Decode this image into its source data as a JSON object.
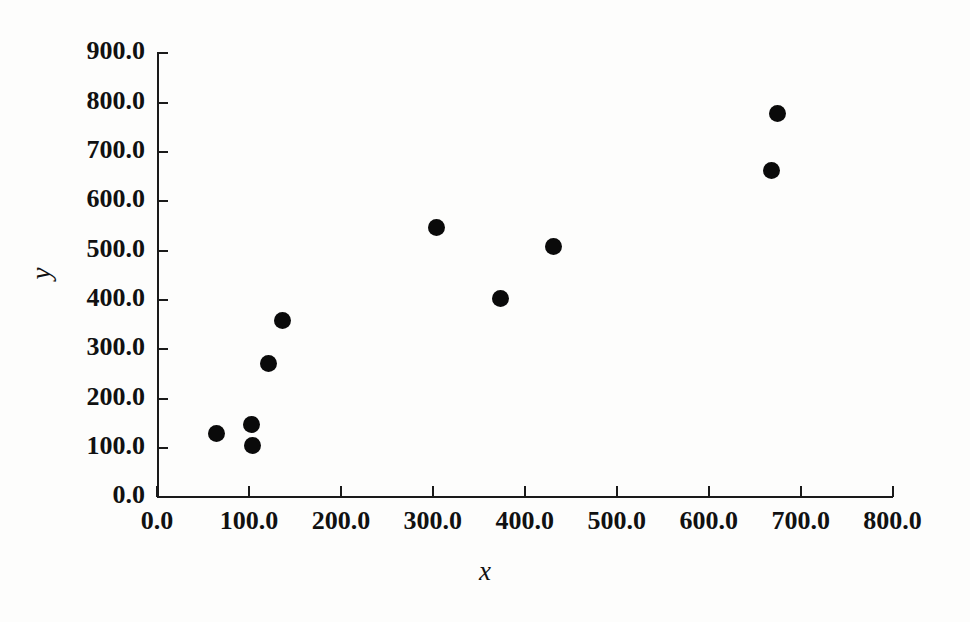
{
  "chart_data": {
    "type": "scatter",
    "title": "",
    "xlabel": "x",
    "ylabel": "y",
    "xlim": [
      0,
      800
    ],
    "ylim": [
      0,
      900
    ],
    "grid": false,
    "legend": false,
    "xticks": [
      "0.0",
      "100.0",
      "200.0",
      "300.0",
      "400.0",
      "500.0",
      "600.0",
      "700.0",
      "800.0"
    ],
    "xtick_values": [
      0,
      100,
      200,
      300,
      400,
      500,
      600,
      700,
      800
    ],
    "yticks": [
      "0.0",
      "100.0",
      "200.0",
      "300.0",
      "400.0",
      "500.0",
      "600.0",
      "700.0",
      "800.0",
      "900.0"
    ],
    "ytick_values": [
      0,
      100,
      200,
      300,
      400,
      500,
      600,
      700,
      800,
      900
    ],
    "marker": "filled-circle",
    "marker_color": "#0a0a0a",
    "marker_size_px": 17,
    "points": [
      {
        "x": 65,
        "y": 129
      },
      {
        "x": 103,
        "y": 148
      },
      {
        "x": 104,
        "y": 105
      },
      {
        "x": 121,
        "y": 271
      },
      {
        "x": 136,
        "y": 358
      },
      {
        "x": 304,
        "y": 546
      },
      {
        "x": 374,
        "y": 403
      },
      {
        "x": 431,
        "y": 509
      },
      {
        "x": 668,
        "y": 662
      },
      {
        "x": 675,
        "y": 778
      }
    ]
  },
  "colors": {
    "axis": "#1a1a1a",
    "text": "#111111",
    "background": "#fdfdfc",
    "marker": "#0a0a0a"
  }
}
